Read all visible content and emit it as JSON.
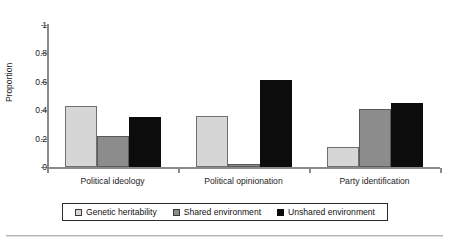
{
  "chart_data": {
    "type": "bar",
    "title": "",
    "xlabel": "",
    "ylabel": "Proportion",
    "ylim": [
      0,
      1
    ],
    "yticks": [
      "0",
      "0.2",
      "0.4",
      "0.6",
      "0.8",
      "1"
    ],
    "grid": false,
    "legend_position": "bottom",
    "categories": [
      "Political ideology",
      "Political opinionation",
      "Party identification"
    ],
    "series": [
      {
        "name": "Genetic heritability",
        "color": "#d6d6d6",
        "values": [
          0.43,
          0.36,
          0.14
        ]
      },
      {
        "name": "Shared environment",
        "color": "#8c8c8c",
        "values": [
          0.22,
          0.02,
          0.41
        ]
      },
      {
        "name": "Unshared environment",
        "color": "#0c0c0c",
        "values": [
          0.35,
          0.61,
          0.45
        ]
      }
    ]
  }
}
